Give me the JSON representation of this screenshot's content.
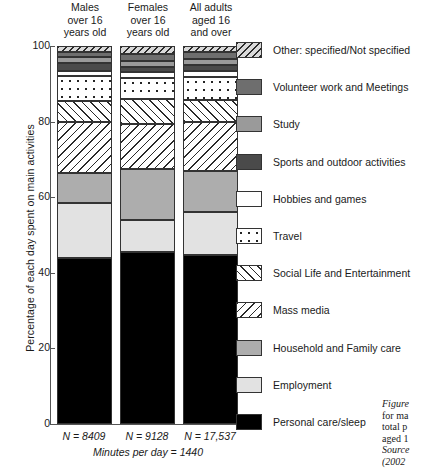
{
  "axis": {
    "ylabel": "Percentage of each day spent on main activities",
    "yticks": [
      "0",
      "20",
      "40",
      "60",
      "80",
      "100"
    ],
    "minutes_note": "Minutes per day = 1440"
  },
  "columns": [
    {
      "header": "Males\nover 16\nyears old",
      "h1": "Males",
      "h2": "over 16",
      "h3": "years old",
      "n": "N = 8409"
    },
    {
      "header": "Females\nover 16\nyears old",
      "h1": "Females",
      "h2": "over 16",
      "h3": "years old",
      "n": "N = 9128"
    },
    {
      "header": "All adults\naged 16\nand over",
      "h1": "All adults",
      "h2": "aged 16",
      "h3": "and over",
      "n": "N = 17,537"
    }
  ],
  "legend": [
    {
      "label": "Other: specified/Not specified",
      "key": "other"
    },
    {
      "label": "Volunteer work and Meetings",
      "key": "volunteer"
    },
    {
      "label": "Study",
      "key": "study"
    },
    {
      "label": "Sports and outdoor activities",
      "key": "sports"
    },
    {
      "label": "Hobbies and games",
      "key": "hobbies"
    },
    {
      "label": "Travel",
      "key": "travel"
    },
    {
      "label": "Social Life and Entertainment",
      "key": "social"
    },
    {
      "label": "Mass media",
      "key": "mass_media"
    },
    {
      "label": "Household and Family care",
      "key": "household"
    },
    {
      "label": "Employment",
      "key": "employment"
    },
    {
      "label": "Personal care/sleep",
      "key": "personal"
    }
  ],
  "caption": {
    "l1": "Figure",
    "l2": "for ma",
    "l3": "total p",
    "l4": "aged 1",
    "l5": "Source",
    "l6": "(2002"
  },
  "chart_data": {
    "type": "bar",
    "subtype": "stacked-100-percent",
    "title": "",
    "xlabel": "",
    "ylabel": "Percentage of each day spent on main activities",
    "ylim": [
      0,
      100
    ],
    "yticks": [
      0,
      20,
      40,
      60,
      80,
      100
    ],
    "grid": false,
    "legend_position": "right",
    "categories": [
      "Males over 16 years old",
      "Females over 16 years old",
      "All adults aged 16 and over"
    ],
    "sample_sizes": [
      "N = 8409",
      "N = 9128",
      "N = 17,537"
    ],
    "note": "Minutes per day = 1440",
    "stack_order_bottom_to_top": [
      "Personal care/sleep",
      "Employment",
      "Household and Family care",
      "Mass media",
      "Social Life and Entertainment",
      "Travel",
      "Hobbies and games",
      "Sports and outdoor activities",
      "Study",
      "Volunteer work and Meetings",
      "Other: specified/Not specified"
    ],
    "series": [
      {
        "name": "Personal care/sleep",
        "values": [
          44.0,
          45.5,
          44.8
        ]
      },
      {
        "name": "Employment",
        "values": [
          14.5,
          8.5,
          11.4
        ]
      },
      {
        "name": "Household and Family care",
        "values": [
          8.0,
          13.5,
          10.8
        ]
      },
      {
        "name": "Mass media",
        "values": [
          13.5,
          12.0,
          12.8
        ]
      },
      {
        "name": "Social Life and Entertainment",
        "values": [
          5.5,
          6.5,
          6.0
        ]
      },
      {
        "name": "Travel",
        "values": [
          6.5,
          5.5,
          6.0
        ]
      },
      {
        "name": "Hobbies and games",
        "values": [
          1.5,
          1.5,
          1.5
        ]
      },
      {
        "name": "Sports and outdoor activities",
        "values": [
          2.0,
          1.5,
          1.8
        ]
      },
      {
        "name": "Study",
        "values": [
          1.5,
          1.5,
          1.5
        ]
      },
      {
        "name": "Volunteer work and Meetings",
        "values": [
          1.5,
          2.0,
          1.7
        ]
      },
      {
        "name": "Other: specified/Not specified",
        "values": [
          1.5,
          2.0,
          1.7
        ]
      }
    ]
  }
}
